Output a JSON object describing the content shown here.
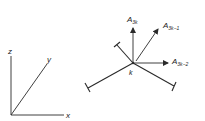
{
  "figure": {
    "stroke_color": "#2a2a2a",
    "axes": {
      "z_label": "z",
      "y_label": "y",
      "x_label": "x"
    },
    "node": {
      "label": "k"
    },
    "force_vectors": [
      {
        "base": "A",
        "subscript": "3k"
      },
      {
        "base": "A",
        "subscript": "3k−1"
      },
      {
        "base": "A",
        "subscript": "3k−2"
      }
    ],
    "members": [
      {
        "name": "upper-left member"
      },
      {
        "name": "lower-left member"
      },
      {
        "name": "lower-right member"
      }
    ]
  }
}
